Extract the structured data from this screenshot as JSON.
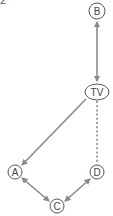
{
  "question_number": "2",
  "colors": {
    "edge": "#8a8a8a",
    "node_stroke": "#555555",
    "text": "#444444",
    "background": "#ffffff"
  },
  "nodes": [
    {
      "id": "B",
      "label": "B",
      "shape": "circle",
      "cx": 97,
      "cy": 11,
      "r": 8
    },
    {
      "id": "TV",
      "label": "TV",
      "shape": "ellipse",
      "cx": 97,
      "cy": 92,
      "rx": 12,
      "ry": 8
    },
    {
      "id": "A",
      "label": "A",
      "shape": "circle",
      "cx": 15,
      "cy": 172,
      "r": 7
    },
    {
      "id": "D",
      "label": "D",
      "shape": "circle",
      "cx": 97,
      "cy": 172,
      "r": 7
    },
    {
      "id": "C",
      "label": "C",
      "shape": "circle",
      "cx": 57,
      "cy": 206,
      "r": 7
    }
  ],
  "edges": [
    {
      "from": "B",
      "to": "TV",
      "style": "solid",
      "arrows": "both"
    },
    {
      "from": "TV",
      "to": "A",
      "style": "solid",
      "arrows": "end"
    },
    {
      "from": "TV",
      "to": "D",
      "style": "dotted",
      "arrows": "none"
    },
    {
      "from": "A",
      "to": "C",
      "style": "solid",
      "arrows": "both"
    },
    {
      "from": "C",
      "to": "D",
      "style": "solid",
      "arrows": "both"
    }
  ]
}
